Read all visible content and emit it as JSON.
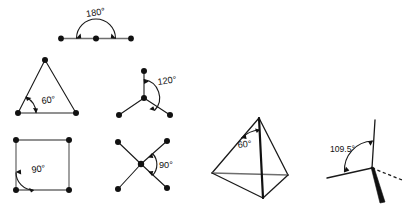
{
  "figure": {
    "background_color": "#ffffff",
    "ink_color": "#111111",
    "accent_grey": "#6e6e6e",
    "panels": [
      {
        "id": "linear",
        "name": "linear-geometry",
        "angle_label": "180°",
        "shape": "straight-line",
        "vertex_count": 3
      },
      {
        "id": "trigonal-planar-triangle",
        "name": "equilateral-triangle",
        "angle_label": "60°",
        "shape": "triangle",
        "vertex_count": 3
      },
      {
        "id": "trigonal-planar-y",
        "name": "trigonal-planar-geometry",
        "angle_label": "120°",
        "shape": "three-branch-star",
        "vertex_count": 4
      },
      {
        "id": "square-planar",
        "name": "square-geometry",
        "angle_label": "90°",
        "shape": "square",
        "vertex_count": 4
      },
      {
        "id": "cross-x",
        "name": "crossed-bonds-geometry",
        "angle_label": "90°",
        "shape": "x-cross",
        "vertex_count": 5
      },
      {
        "id": "tetrahedron-solid",
        "name": "tetrahedron-solid",
        "angle_label": "60°",
        "shape": "tetrahedron",
        "vertex_count": 4
      },
      {
        "id": "tetrahedral-bond",
        "name": "tetrahedral-bond-angle",
        "angle_label": "109.5°",
        "shape": "tetrahedral-center",
        "vertex_count": 1
      }
    ]
  }
}
